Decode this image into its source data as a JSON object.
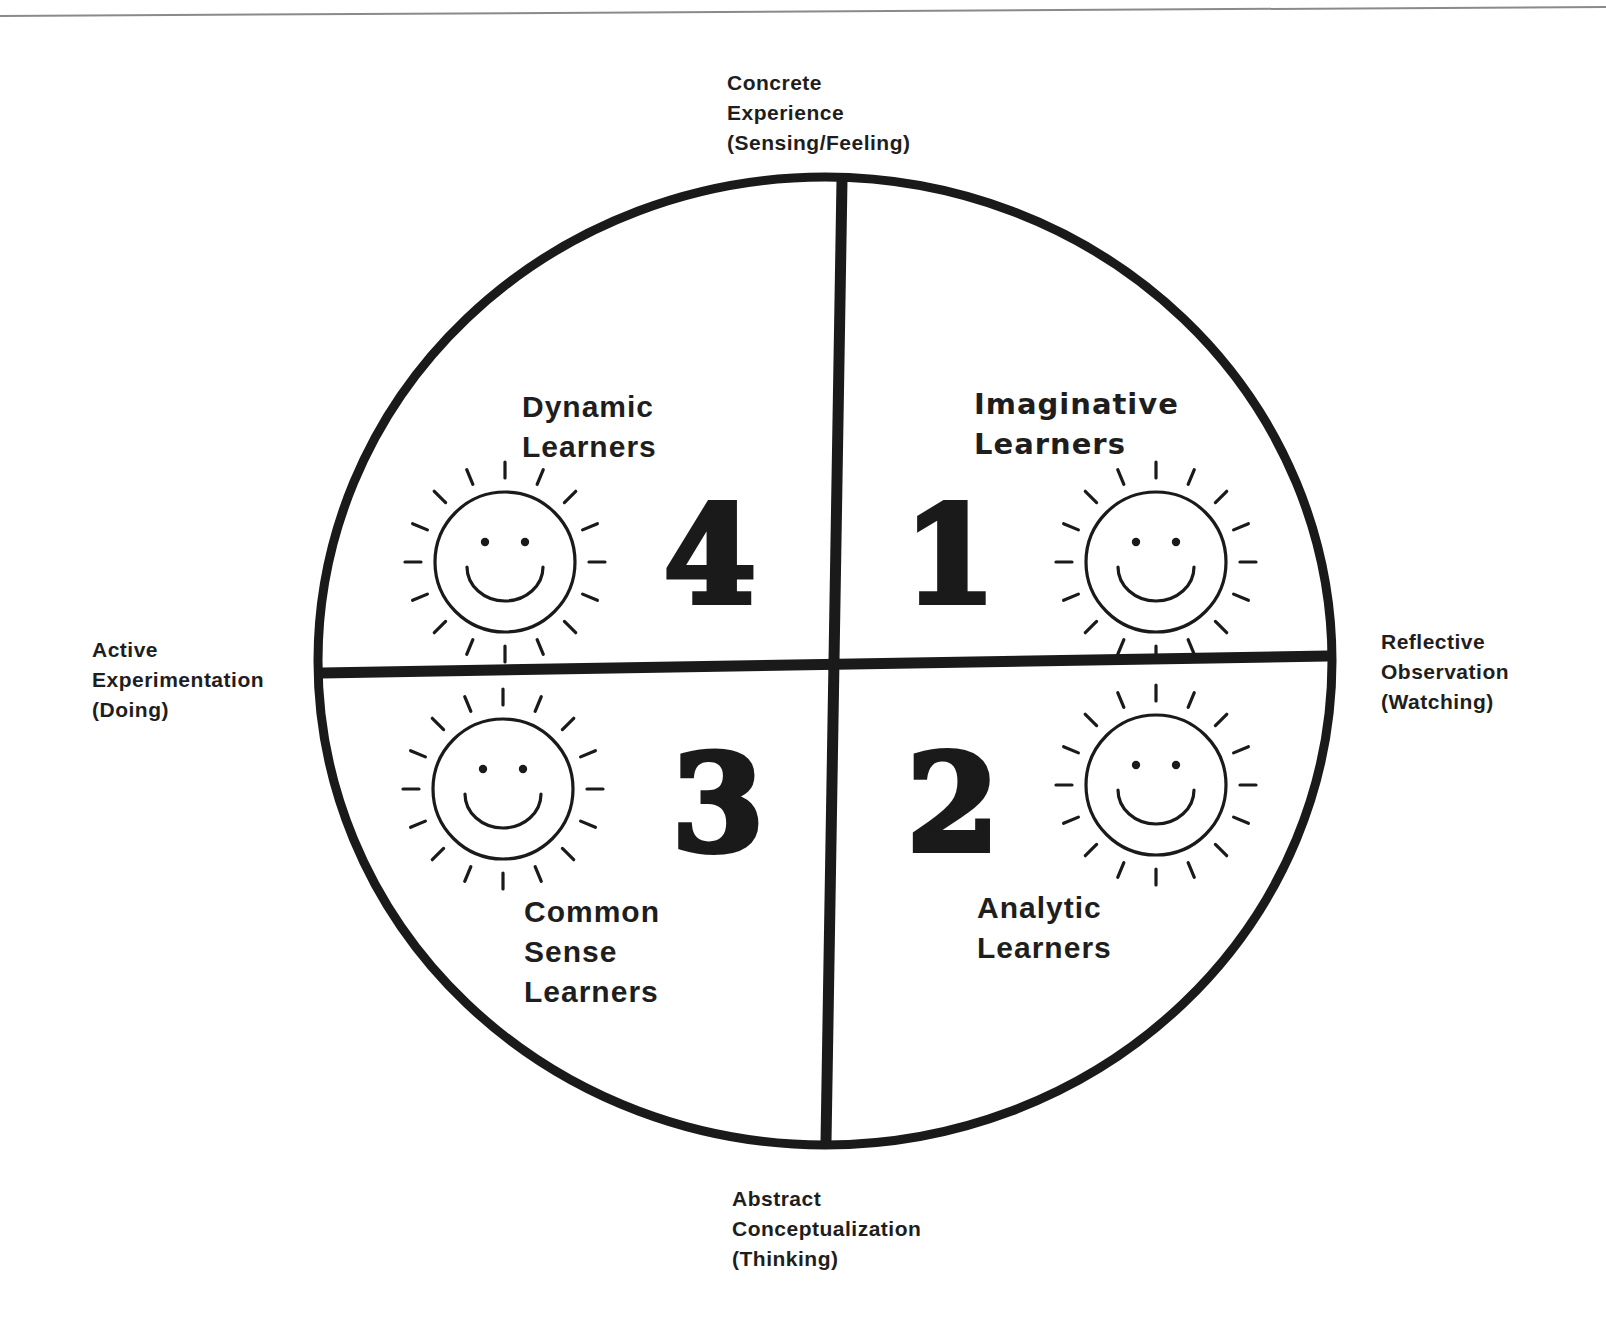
{
  "diagram": {
    "type": "learning-styles-circle",
    "colors": {
      "ink": "#1a1a1a",
      "background": "#ffffff",
      "scan_line": "#8a8a8a"
    },
    "circle": {
      "cx": 825,
      "cy": 661,
      "rx": 507,
      "ry": 484,
      "stroke_width": 9
    },
    "axes": {
      "top": {
        "lines": [
          "Concrete",
          "Experience",
          "(Sensing/Feeling)"
        ]
      },
      "right": {
        "lines": [
          "Reflective",
          "Observation",
          "(Watching)"
        ]
      },
      "bottom": {
        "lines": [
          "Abstract",
          "Conceptualization",
          "(Thinking)"
        ]
      },
      "left": {
        "lines": [
          "Active",
          "Experimentation",
          "(Doing)"
        ]
      }
    },
    "quadrants": [
      {
        "id": "q1",
        "number": "1",
        "title_lines": [
          "Imaginative",
          "Learners"
        ],
        "icon": "smiley-sun-icon"
      },
      {
        "id": "q2",
        "number": "2",
        "title_lines": [
          "Analytic",
          "Learners"
        ],
        "icon": "smiley-sun-icon"
      },
      {
        "id": "q3",
        "number": "3",
        "title_lines": [
          "Common",
          "Sense",
          "Learners"
        ],
        "icon": "smiley-sun-icon"
      },
      {
        "id": "q4",
        "number": "4",
        "title_lines": [
          "Dynamic",
          "Learners"
        ],
        "icon": "smiley-sun-icon"
      }
    ]
  }
}
